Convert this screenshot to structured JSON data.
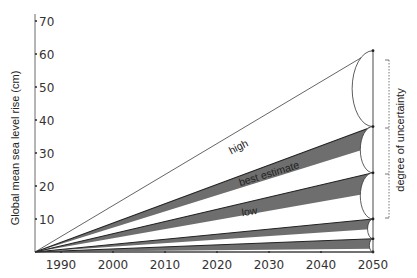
{
  "chart_data": {
    "type": "line",
    "title": "",
    "xlabel": "",
    "ylabel": "Global mean sea level rise (cm)",
    "x_ticks": [
      1990,
      2000,
      2010,
      2020,
      2030,
      2040,
      2050
    ],
    "y_ticks": [
      10,
      20,
      30,
      40,
      50,
      60,
      70
    ],
    "xlim": [
      1985,
      2050
    ],
    "ylim": [
      0,
      72
    ],
    "grid": false,
    "legend": "none",
    "origin": {
      "x": 1985,
      "y": 0
    },
    "series": [
      {
        "name": "high",
        "x": [
          1985,
          2050
        ],
        "values": [
          0,
          61
        ]
      },
      {
        "name": "upper band top",
        "x": [
          1985,
          2050
        ],
        "values": [
          0,
          38
        ]
      },
      {
        "name": "best estimate",
        "x": [
          1985,
          2050
        ],
        "values": [
          0,
          24
        ]
      },
      {
        "name": "low",
        "x": [
          1985,
          2050
        ],
        "values": [
          0,
          10
        ]
      },
      {
        "name": "lowest",
        "x": [
          1985,
          2050
        ],
        "values": [
          0,
          4
        ]
      },
      {
        "name": "baseline",
        "x": [
          1985,
          2050
        ],
        "values": [
          0,
          0
        ]
      }
    ],
    "shaded_bands_at_2050": [
      {
        "from": 32,
        "to": 38
      },
      {
        "from": 18,
        "to": 24
      },
      {
        "from": 7,
        "to": 10
      },
      {
        "from": 1,
        "to": 4
      }
    ],
    "annotations": [
      {
        "text": "high",
        "x": 2018,
        "y": 37
      },
      {
        "text": "best estimate",
        "x": 2024,
        "y": 24
      },
      {
        "text": "low",
        "x": 2023,
        "y": 12
      },
      {
        "text": "degree of uncertainty",
        "type": "bracket",
        "x": 2050,
        "y_range": [
          10,
          58
        ]
      }
    ]
  },
  "labels": {
    "ylabel": "Global mean sea level rise (cm)",
    "high": "high",
    "best": "best estimate",
    "low": "low",
    "uncertainty": "degree of uncertainty"
  },
  "colors": {
    "band": "#6e6e6e",
    "line": "#222222",
    "axis": "#444444"
  }
}
